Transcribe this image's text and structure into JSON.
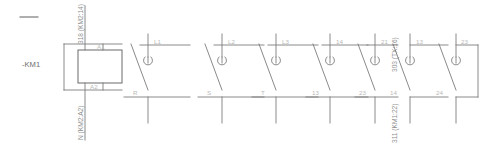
{
  "diagram": {
    "device_label": "-KM1",
    "top_dash": "—",
    "coil": {
      "terminal_top": "A1",
      "terminal_bottom": "A2",
      "wire_top_label": "318 (KM2:14)",
      "wire_bottom_label": "N (KM2:A2)"
    },
    "poles": [
      {
        "top_label": "L1",
        "bottom_label": "R",
        "type": "main"
      },
      {
        "top_label": "L2",
        "bottom_label": "S",
        "type": "main"
      },
      {
        "top_label": "L3",
        "bottom_label": "T",
        "type": "main"
      },
      {
        "top_label": "14",
        "bottom_label": "13",
        "type": "aux"
      },
      {
        "top_label": "21",
        "bottom_label": "23",
        "type": "aux"
      },
      {
        "top_label": "13",
        "bottom_label": "14",
        "type": "aux"
      },
      {
        "top_label": "23",
        "bottom_label": "24",
        "type": "aux"
      }
    ],
    "vertical_labels": [
      {
        "text": "303 (TX:16)"
      },
      {
        "text": "311 (KM1:22)"
      }
    ],
    "colors": {
      "wire": "#7d7d7d",
      "wire_dark": "#5f5f5f",
      "label_light": "#b9b9b9",
      "label_dark": "#6d6d6d",
      "background": "#ffffff"
    }
  }
}
